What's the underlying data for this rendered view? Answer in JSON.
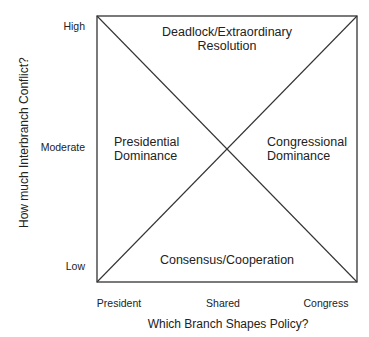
{
  "diagram": {
    "box": {
      "x": 97,
      "y": 16,
      "width": 260,
      "height": 266,
      "stroke": "#333333"
    },
    "y_axis": {
      "title": "How much Interbranch Conflict?",
      "ticks": [
        "High",
        "Moderate",
        "Low"
      ]
    },
    "x_axis": {
      "title": "Which Branch Shapes Policy?",
      "ticks": [
        "President",
        "Shared",
        "Congress"
      ]
    },
    "quadrants": {
      "top": {
        "line1": "Deadlock/Extraordinary",
        "line2": "Resolution"
      },
      "left": {
        "line1": "Presidential",
        "line2": "Dominance"
      },
      "right": {
        "line1": "Congressional",
        "line2": "Dominance"
      },
      "bottom": {
        "line1": "Consensus/Cooperation"
      }
    }
  }
}
